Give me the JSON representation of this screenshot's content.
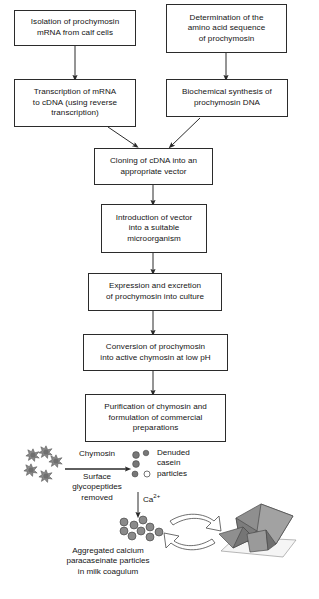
{
  "figure": {
    "type": "process-flowchart"
  },
  "flow_boxes": [
    {
      "id": "isolation",
      "text": "Isolation of prochymosin\nmRNA from calf cells"
    },
    {
      "id": "determination",
      "text": "Determination of the\namino acid sequence\nof prochymosin"
    },
    {
      "id": "transcription",
      "text": "Transcription of mRNA\nto cDNA (using reverse\ntranscription)"
    },
    {
      "id": "biochemical",
      "text": "Biochemical synthesis of\nprochymosin DNA"
    },
    {
      "id": "cloning",
      "text": "Cloning of cDNA into an\nappropriate vector"
    },
    {
      "id": "introduction",
      "text": "Introduction of vector\ninto a suitable\nmicroorganism"
    },
    {
      "id": "expression",
      "text": "Expression and excretion\nof prochymosin into culture"
    },
    {
      "id": "conversion",
      "text": "Conversion of prochymosin\ninto active chymosin at low pH"
    },
    {
      "id": "purification",
      "text": "Purification of chymosin and\nformulation of commercial\npreparations"
    }
  ],
  "reaction": {
    "reagent_above": "Chymosin",
    "reagent_below": "Surface\nglycopeptides\nremoved",
    "product_label": "Denuded\ncasein\nparticles",
    "ion_label_main": "Ca",
    "ion_label_sup": "2+",
    "coagulum_caption": "Aggregated calcium\nparacaseinate particles\nin milk coagulum"
  },
  "colors": {
    "line": "#2b2b2b",
    "text": "#141414",
    "particle_fill": "#8a8a8a",
    "particle_stroke": "#3a3a3a",
    "cheese_fill": "#8f8f8f",
    "cheese_dark": "#707070",
    "cheese_light": "#b5b5b5",
    "plate_fill": "#f2f2f2",
    "arrow_fill": "#ffffff",
    "background": "#ffffff"
  }
}
